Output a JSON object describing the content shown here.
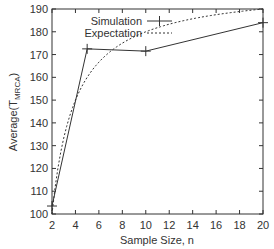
{
  "chart_data": {
    "type": "line",
    "title": "",
    "xlabel": "Sample Size, n",
    "ylabel": "Average(T",
    "ylabel_subscript": "MRCA",
    "ylabel_suffix": ")",
    "xlim": [
      2,
      20
    ],
    "ylim": [
      100,
      190
    ],
    "xticks": [
      2,
      4,
      6,
      8,
      10,
      12,
      14,
      16,
      18,
      20
    ],
    "yticks": [
      100,
      110,
      120,
      130,
      140,
      150,
      160,
      170,
      180,
      190
    ],
    "grid": false,
    "legend_position": "top-left",
    "series": [
      {
        "name": "Simulation",
        "style": "solid",
        "marker": "plus",
        "x": [
          2,
          5,
          10,
          20
        ],
        "y": [
          103.5,
          172.5,
          171.5,
          184
        ]
      },
      {
        "name": "Expectation",
        "style": "dotted",
        "marker": "none",
        "x": [
          2,
          3,
          4,
          5,
          6,
          7,
          8,
          10,
          12,
          14,
          16,
          18,
          20
        ],
        "y": [
          100,
          133.3,
          150,
          160,
          166.7,
          171.4,
          175,
          180,
          183.3,
          185.7,
          187.5,
          188.9,
          190
        ]
      }
    ]
  }
}
